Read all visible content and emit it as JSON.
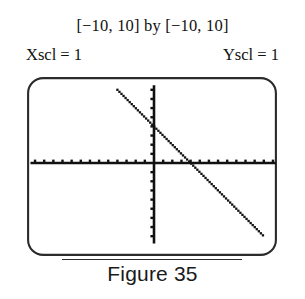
{
  "figure": {
    "range_label": "[−10, 10] by [−10, 10]",
    "xscl_label": "Xscl = 1",
    "yscl_label": "Yscl = 1",
    "caption": "Figure 35"
  },
  "colors": {
    "ink": "#111111",
    "screen_border": "#2b2b2b",
    "screen_fill": "#ffffff",
    "plot": "#111111"
  },
  "chart_data": {
    "type": "line",
    "title": "[−10, 10] by [−10, 10]",
    "xlabel": "",
    "ylabel": "",
    "xlim": [
      -10,
      10
    ],
    "ylim": [
      -10,
      10
    ],
    "xscl": 1,
    "yscl": 1,
    "grid": false,
    "legend": null,
    "render_style": "dotted-pixel-trace",
    "axes": {
      "x_axis_y": 0,
      "y_axis_x": 0,
      "tick_interval_x": 1,
      "tick_interval_y": 1,
      "x_axis_pixel_span": [
        -13.5,
        13.3
      ],
      "y_axis_pixel_span": [
        8.5,
        -8.8
      ]
    },
    "series": [
      {
        "name": "y = -x + 4",
        "slope": -1,
        "intercept": 4,
        "x": [
          -4.0,
          -3.0,
          -2.0,
          -1.0,
          0.0,
          1.0,
          2.0,
          3.0,
          4.0,
          5.0,
          6.0,
          7.0,
          8.0,
          9.0,
          10.0,
          11.0,
          12.0
        ],
        "values": [
          8.0,
          7.0,
          6.0,
          5.0,
          4.0,
          3.0,
          2.0,
          1.0,
          0.0,
          -1.0,
          -2.0,
          -3.0,
          -4.0,
          -5.0,
          -6.0,
          -7.0,
          -8.0
        ],
        "x_intercept": 4,
        "y_intercept": 4
      }
    ]
  }
}
